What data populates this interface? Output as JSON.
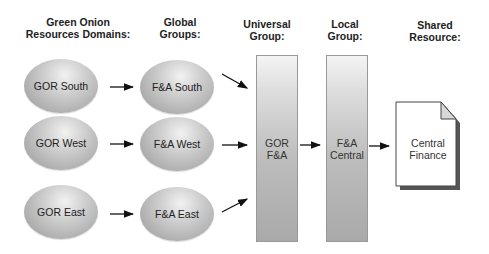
{
  "headers": {
    "domains": [
      "Green Onion",
      "Resources Domains:"
    ],
    "global": [
      "Global",
      "Groups:"
    ],
    "universal": [
      "Universal",
      "Group:"
    ],
    "local": [
      "Local",
      "Group:"
    ],
    "shared": [
      "Shared",
      "Resource:"
    ]
  },
  "domains": [
    {
      "label": "GOR South"
    },
    {
      "label": "GOR West"
    },
    {
      "label": "GOR East"
    }
  ],
  "global_groups": [
    {
      "label": "F&A South"
    },
    {
      "label": "F&A West"
    },
    {
      "label": "F&A East"
    }
  ],
  "universal_group": {
    "line1": "GOR",
    "line2": "F&A"
  },
  "local_group": {
    "line1": "F&A",
    "line2": "Central"
  },
  "shared_resource": {
    "line1": "Central",
    "line2": "Finance"
  }
}
